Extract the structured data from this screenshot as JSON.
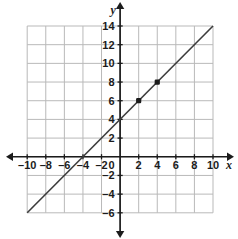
{
  "chart_data": {
    "type": "line",
    "title": "",
    "xlabel": "x",
    "ylabel": "y",
    "xlim": [
      -10,
      10
    ],
    "ylim": [
      -6,
      14
    ],
    "grid": true,
    "legend": "none",
    "equation": "y = x + 4",
    "slope": 1,
    "intercept": 4,
    "x_ticks": [
      -10,
      -8,
      -6,
      -4,
      -2,
      0,
      2,
      4,
      6,
      8,
      10
    ],
    "x_tick_labels": [
      "–10",
      "–8",
      "–6",
      "–4",
      "–2",
      "0",
      "2",
      "4",
      "6",
      "8",
      "10"
    ],
    "y_ticks": [
      14,
      12,
      10,
      8,
      6,
      4,
      2,
      0,
      -2,
      -4,
      -6
    ],
    "y_tick_labels": [
      "14",
      "12",
      "10",
      "8",
      "6",
      "4",
      "2",
      "0",
      "–2",
      "–4",
      "–6"
    ],
    "series": [
      {
        "name": "y = x + 4",
        "x": [
          -10,
          10
        ],
        "values": [
          -6,
          14
        ]
      }
    ],
    "points": [
      {
        "x": 2,
        "y": 6,
        "label": "(2, 6)"
      },
      {
        "x": 4,
        "y": 8,
        "label": "(4, 8)"
      }
    ],
    "x_intercept": -4,
    "y_intercept": 4,
    "colors": {
      "line": "#3c3c3c",
      "grid": "#b9b9b9",
      "axis": "#1b1b1b",
      "point": "#1b1b1b",
      "background": "#ffffff"
    }
  }
}
